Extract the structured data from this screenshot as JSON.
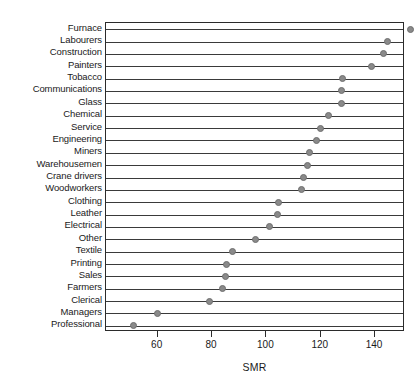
{
  "chart_data": {
    "type": "scatter",
    "subtype": "cleveland-dot-plot",
    "title": "",
    "xlabel": "SMR",
    "ylabel": "",
    "xlim": [
      41,
      151
    ],
    "xticks": [
      60,
      80,
      100,
      120,
      140
    ],
    "grid": "horizontal-rules-per-category",
    "legend": "none",
    "orientation": "horizontal",
    "marker": {
      "shape": "circle",
      "fill": "#8a8a8a",
      "edge": "#6e6e6e",
      "size_px": 7
    },
    "categories": [
      "Furnace",
      "Labourers",
      "Construction",
      "Painters",
      "Tobacco",
      "Communications",
      "Glass",
      "Chemical",
      "Service",
      "Engineering",
      "Miners",
      "Warehousemen",
      "Crane drivers",
      "Woodworkers",
      "Clothing",
      "Leather",
      "Electrical",
      "Other",
      "Textile",
      "Printing",
      "Sales",
      "Farmers",
      "Clerical",
      "Managers",
      "Professional"
    ],
    "values": [
      153,
      144.5,
      143,
      138.5,
      128,
      127.5,
      127.5,
      123,
      120,
      118.5,
      116,
      115,
      113.5,
      113,
      104.5,
      104,
      101,
      96,
      87.5,
      85.5,
      85,
      84,
      79,
      60,
      51
    ],
    "points": [
      {
        "category": "Furnace",
        "value": 153
      },
      {
        "category": "Labourers",
        "value": 144.5
      },
      {
        "category": "Construction",
        "value": 143
      },
      {
        "category": "Painters",
        "value": 138.5
      },
      {
        "category": "Tobacco",
        "value": 128
      },
      {
        "category": "Communications",
        "value": 127.5
      },
      {
        "category": "Glass",
        "value": 127.5
      },
      {
        "category": "Chemical",
        "value": 123
      },
      {
        "category": "Service",
        "value": 120
      },
      {
        "category": "Engineering",
        "value": 118.5
      },
      {
        "category": "Miners",
        "value": 116
      },
      {
        "category": "Warehousemen",
        "value": 115
      },
      {
        "category": "Crane drivers",
        "value": 113.5
      },
      {
        "category": "Woodworkers",
        "value": 113
      },
      {
        "category": "Clothing",
        "value": 104.5
      },
      {
        "category": "Leather",
        "value": 104
      },
      {
        "category": "Electrical",
        "value": 101
      },
      {
        "category": "Other",
        "value": 96
      },
      {
        "category": "Textile",
        "value": 87.5
      },
      {
        "category": "Printing",
        "value": 85.5
      },
      {
        "category": "Sales",
        "value": 85
      },
      {
        "category": "Farmers",
        "value": 84
      },
      {
        "category": "Clerical",
        "value": 79
      },
      {
        "category": "Managers",
        "value": 60
      },
      {
        "category": "Professional",
        "value": 51
      }
    ]
  },
  "colors": {
    "marker_fill": "#8a8a8a",
    "marker_edge": "#6e6e6e",
    "axis": "#2b2b2b",
    "rule": "#3a3a3a",
    "text": "#1a1a1a",
    "background": "#ffffff"
  }
}
